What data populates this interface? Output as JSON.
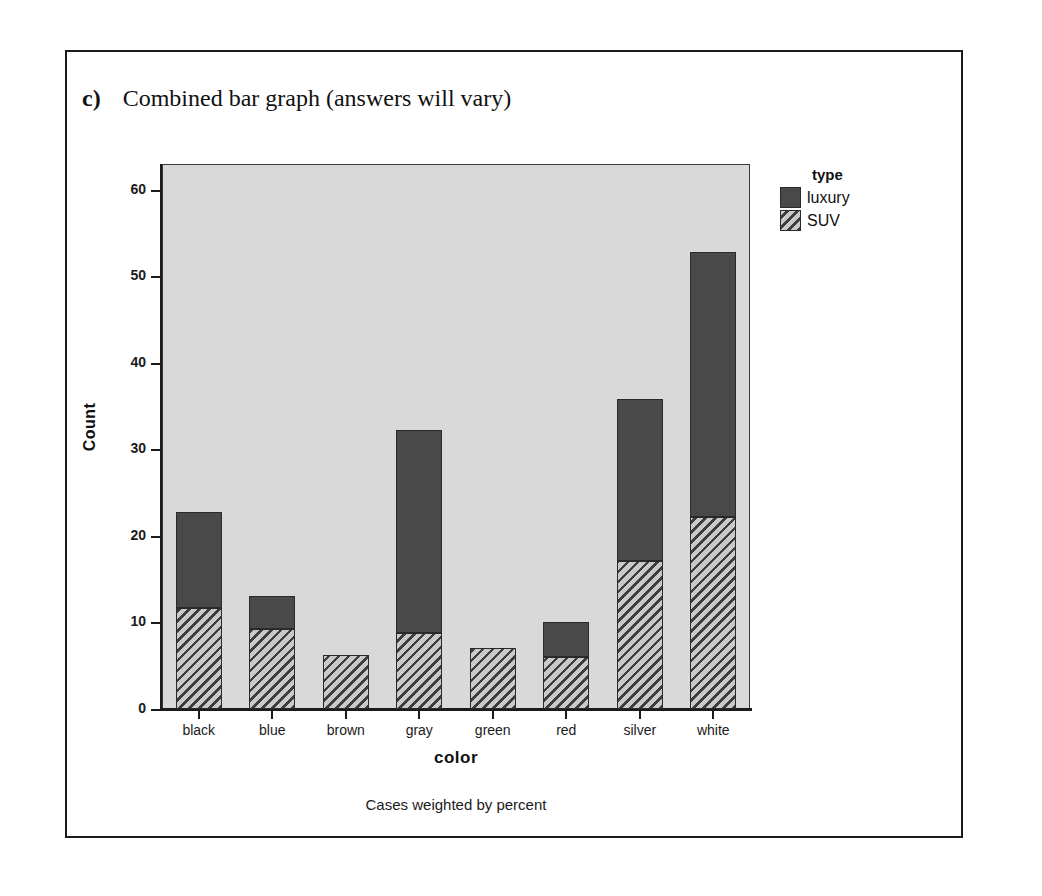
{
  "heading": {
    "letter": "c)",
    "text": "Combined bar graph (answers will vary)"
  },
  "caption": "Cases weighted by percent",
  "legend": {
    "title": "type",
    "entries": [
      {
        "label": "luxury",
        "swatch": "solid-dark-gray"
      },
      {
        "label": "SUV",
        "swatch": "diagonal-hatch"
      }
    ]
  },
  "chart_data": {
    "type": "bar",
    "subtype": "stacked",
    "title": "",
    "xlabel": "color",
    "ylabel": "Count",
    "categories": [
      "black",
      "blue",
      "brown",
      "gray",
      "green",
      "red",
      "silver",
      "white"
    ],
    "series": [
      {
        "name": "SUV",
        "values": [
          11.7,
          9.3,
          6.3,
          8.8,
          7.0,
          6.0,
          17.1,
          22.2
        ]
      },
      {
        "name": "luxury",
        "values": [
          11.1,
          3.8,
          0.0,
          23.4,
          0.0,
          4.1,
          18.7,
          30.6
        ]
      }
    ],
    "totals": [
      22.8,
      13.1,
      6.3,
      32.2,
      7.0,
      10.1,
      35.8,
      52.8
    ],
    "ylim": [
      0,
      63
    ],
    "yticks": [
      0,
      10,
      20,
      30,
      40,
      50,
      60
    ],
    "ytick_labels": [
      "0",
      "10",
      "20",
      "30",
      "40",
      "50",
      "60"
    ],
    "grid": false,
    "legend_position": "right-top",
    "annotation": "Cases weighted by percent",
    "colors": {
      "panel_background": "#d9d9d9",
      "luxury": "#494949",
      "suv_hatch_dark": "#3d3d3d",
      "suv_hatch_light": "#c9c9c9",
      "axis": "#1b1b1b"
    }
  }
}
